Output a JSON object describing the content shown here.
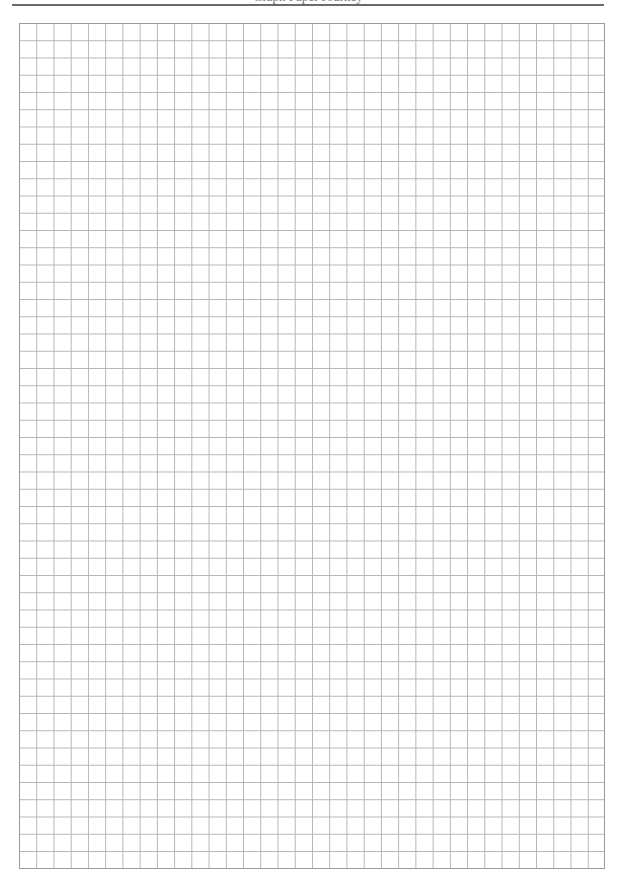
{
  "header": {
    "text": "Graph Paper Journey",
    "rule_color": "#6a6a6a"
  },
  "grid": {
    "columns": 34,
    "rows": 49,
    "line_color": "#b4b4b4",
    "border_color": "#9a9a9a"
  }
}
